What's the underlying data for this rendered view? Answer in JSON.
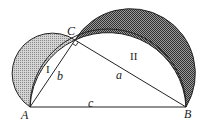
{
  "diagram": {
    "points": {
      "A": {
        "label": "A",
        "x": 30,
        "y": 107
      },
      "B": {
        "label": "B",
        "x": 186,
        "y": 107
      },
      "C": {
        "label": "C",
        "x": 75,
        "y": 40
      }
    },
    "sides": {
      "a": {
        "label": "a",
        "from": "C",
        "to": "B"
      },
      "b": {
        "label": "b",
        "from": "A",
        "to": "C"
      },
      "c": {
        "label": "c",
        "from": "A",
        "to": "B"
      }
    },
    "regions": {
      "lune_1": {
        "label": "I",
        "over_side": "b",
        "fill": "#b8b8b8"
      },
      "lune_2": {
        "label": "II",
        "over_side": "a",
        "fill": "#7a7a7a"
      }
    },
    "right_angle_at": "C",
    "colors": {
      "stroke": "#222222",
      "background": "#ffffff"
    }
  }
}
